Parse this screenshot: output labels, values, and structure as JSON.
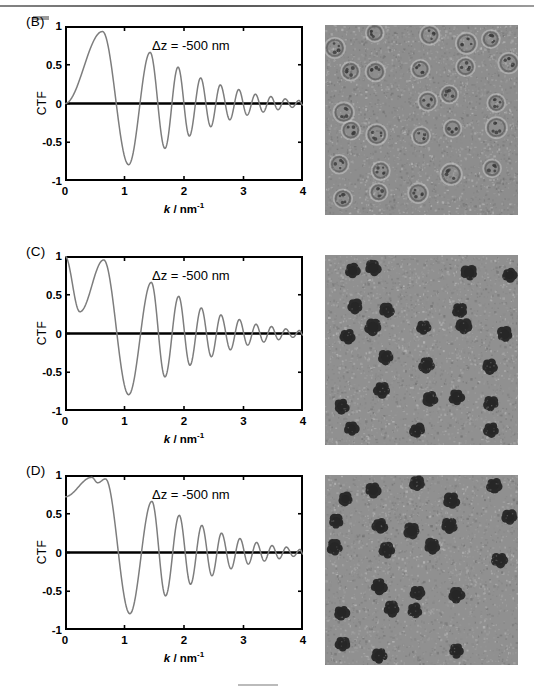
{
  "figure": {
    "panels": [
      {
        "id": "B",
        "label": "(B)",
        "annotation": "Δz = -500 nm",
        "micrograph_name": "cryo-em-micrograph-conventional-phase-contrast",
        "micrograph_contrast": "low",
        "chart_data": {
          "type": "line",
          "title": "",
          "annotation": "Δz = -500 nm",
          "xlabel": "k / nm-1",
          "ylabel": "CTF",
          "xlim": [
            0,
            4
          ],
          "ylim": [
            -1,
            1
          ],
          "xticks": [
            "0",
            "1",
            "2",
            "3",
            "4"
          ],
          "yticks": [
            "1",
            "0.5",
            "0",
            "-0.5",
            "-1"
          ],
          "grid": false,
          "legend": "none",
          "series": [
            {
              "name": "CTF",
              "color": "#7d7d7d",
              "description": "Defocus phase contrast CTF, starts at 0 at k=0, first maximum 0.93 near k=0.63, damped oscillation decaying to 0 at k=4",
              "zero_start": 0.0,
              "envelope_decay": "gaussian",
              "extrema": [
                {
                  "k": 0.0,
                  "ctf": 0.0
                },
                {
                  "k": 0.63,
                  "ctf": 0.93
                },
                {
                  "k": 1.07,
                  "ctf": -0.79
                },
                {
                  "k": 1.43,
                  "ctf": 0.66
                },
                {
                  "k": 1.68,
                  "ctf": -0.58
                },
                {
                  "k": 1.9,
                  "ctf": 0.47
                },
                {
                  "k": 2.09,
                  "ctf": -0.42
                },
                {
                  "k": 2.28,
                  "ctf": 0.33
                },
                {
                  "k": 2.45,
                  "ctf": -0.3
                },
                {
                  "k": 2.61,
                  "ctf": 0.24
                },
                {
                  "k": 2.77,
                  "ctf": -0.21
                },
                {
                  "k": 2.92,
                  "ctf": 0.18
                },
                {
                  "k": 3.06,
                  "ctf": -0.15
                },
                {
                  "k": 3.2,
                  "ctf": 0.12
                },
                {
                  "k": 3.33,
                  "ctf": -0.11
                },
                {
                  "k": 3.46,
                  "ctf": 0.09
                },
                {
                  "k": 3.58,
                  "ctf": -0.08
                },
                {
                  "k": 3.7,
                  "ctf": 0.06
                },
                {
                  "k": 3.82,
                  "ctf": -0.05
                },
                {
                  "k": 3.93,
                  "ctf": 0.04
                },
                {
                  "k": 4.0,
                  "ctf": -0.02
                }
              ]
            }
          ]
        }
      },
      {
        "id": "C",
        "label": "(C)",
        "annotation": "Δz = -500 nm",
        "micrograph_name": "cryo-em-micrograph-phase-plate-high-contrast",
        "micrograph_contrast": "high",
        "chart_data": {
          "type": "line",
          "title": "",
          "annotation": "Δz = -500 nm",
          "xlabel": "k / nm-1",
          "ylabel": "CTF",
          "xlim": [
            0,
            4
          ],
          "ylim": [
            -1,
            1
          ],
          "xticks": [
            "0",
            "1",
            "2",
            "3",
            "4"
          ],
          "yticks": [
            "1",
            "0.5",
            "0",
            "-0.5",
            "-1"
          ],
          "grid": false,
          "legend": "none",
          "series": [
            {
              "name": "CTF",
              "color": "#7d7d7d",
              "description": "Phase plate CTF: starts at 1.0 at k=0, sharp cut-on notch down to 0.28 at k=0.25, recovers to 0.95 at k=0.65, then damped oscillation identical to panel B",
              "zero_start": 1.0,
              "cut_on_k": 0.25,
              "cut_on_min": 0.28,
              "envelope_decay": "gaussian",
              "extrema": [
                {
                  "k": 0.0,
                  "ctf": 1.0
                },
                {
                  "k": 0.25,
                  "ctf": 0.28
                },
                {
                  "k": 0.65,
                  "ctf": 0.95
                },
                {
                  "k": 1.07,
                  "ctf": -0.79
                },
                {
                  "k": 1.45,
                  "ctf": 0.66
                },
                {
                  "k": 1.68,
                  "ctf": -0.56
                },
                {
                  "k": 1.91,
                  "ctf": 0.48
                },
                {
                  "k": 2.1,
                  "ctf": -0.41
                },
                {
                  "k": 2.29,
                  "ctf": 0.33
                },
                {
                  "k": 2.46,
                  "ctf": -0.3
                },
                {
                  "k": 2.62,
                  "ctf": 0.24
                },
                {
                  "k": 2.78,
                  "ctf": -0.21
                },
                {
                  "k": 2.93,
                  "ctf": 0.18
                },
                {
                  "k": 3.07,
                  "ctf": -0.15
                },
                {
                  "k": 3.21,
                  "ctf": 0.12
                },
                {
                  "k": 3.34,
                  "ctf": -0.11
                },
                {
                  "k": 3.47,
                  "ctf": 0.09
                },
                {
                  "k": 3.59,
                  "ctf": -0.08
                },
                {
                  "k": 3.71,
                  "ctf": 0.06
                },
                {
                  "k": 3.83,
                  "ctf": -0.05
                },
                {
                  "k": 3.94,
                  "ctf": 0.04
                },
                {
                  "k": 4.0,
                  "ctf": -0.02
                }
              ]
            }
          ]
        }
      },
      {
        "id": "D",
        "label": "(D)",
        "annotation": "Δz = -500 nm",
        "micrograph_name": "cryo-em-micrograph-phase-plate-high-contrast",
        "micrograph_contrast": "high",
        "chart_data": {
          "type": "line",
          "title": "",
          "annotation": "Δz = -500 nm",
          "xlabel": "k / nm-1",
          "ylabel": "CTF",
          "xlim": [
            0,
            4
          ],
          "ylim": [
            -1,
            1
          ],
          "xticks": [
            "0",
            "1",
            "2",
            "3",
            "4"
          ],
          "yticks": [
            "1",
            "0.5",
            "0",
            "-0.5",
            "-1"
          ],
          "grid": false,
          "legend": "none",
          "series": [
            {
              "name": "CTF",
              "color": "#7d7d7d",
              "description": "Phase plate CTF with smooth low-frequency response: starts at 0.72 at k=0, rises to 0.97 at k=0.45, small notch to 0.9 at k=0.55, second peak 0.95 at k=0.68, then damped oscillation",
              "zero_start": 0.72,
              "envelope_decay": "gaussian",
              "extrema": [
                {
                  "k": 0.0,
                  "ctf": 0.72
                },
                {
                  "k": 0.45,
                  "ctf": 0.97
                },
                {
                  "k": 0.55,
                  "ctf": 0.9
                },
                {
                  "k": 0.68,
                  "ctf": 0.95
                },
                {
                  "k": 1.09,
                  "ctf": -0.79
                },
                {
                  "k": 1.46,
                  "ctf": 0.66
                },
                {
                  "k": 1.69,
                  "ctf": -0.56
                },
                {
                  "k": 1.92,
                  "ctf": 0.48
                },
                {
                  "k": 2.11,
                  "ctf": -0.41
                },
                {
                  "k": 2.3,
                  "ctf": 0.35
                },
                {
                  "k": 2.47,
                  "ctf": -0.3
                },
                {
                  "k": 2.63,
                  "ctf": 0.25
                },
                {
                  "k": 2.79,
                  "ctf": -0.21
                },
                {
                  "k": 2.94,
                  "ctf": 0.18
                },
                {
                  "k": 3.08,
                  "ctf": -0.15
                },
                {
                  "k": 3.22,
                  "ctf": 0.13
                },
                {
                  "k": 3.35,
                  "ctf": -0.11
                },
                {
                  "k": 3.48,
                  "ctf": 0.09
                },
                {
                  "k": 3.6,
                  "ctf": -0.08
                },
                {
                  "k": 3.72,
                  "ctf": 0.07
                },
                {
                  "k": 3.84,
                  "ctf": -0.05
                },
                {
                  "k": 3.95,
                  "ctf": 0.04
                },
                {
                  "k": 4.0,
                  "ctf": -0.02
                }
              ]
            }
          ]
        }
      }
    ]
  }
}
